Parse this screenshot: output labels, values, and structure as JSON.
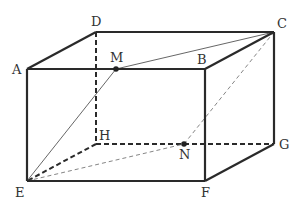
{
  "figure": {
    "type": "rectangular-prism",
    "vertices": {
      "A": "A",
      "B": "B",
      "C": "C",
      "D": "D",
      "E": "E",
      "F": "F",
      "G": "G",
      "H": "H"
    },
    "points": {
      "M": "M",
      "N": "N"
    },
    "visible_edges": [
      "AB",
      "BC",
      "CD",
      "DA",
      "AE",
      "BF",
      "CG",
      "EF",
      "FG"
    ],
    "hidden_edges": [
      "DH",
      "HE",
      "HG"
    ],
    "segments": [
      {
        "name": "EM",
        "style": "thin-solid"
      },
      {
        "name": "MC",
        "style": "thin-solid"
      },
      {
        "name": "EN",
        "style": "thin-dashed"
      },
      {
        "name": "NC",
        "style": "thin-dashed"
      }
    ],
    "point_on": {
      "M": "AB",
      "N": "HG"
    }
  }
}
